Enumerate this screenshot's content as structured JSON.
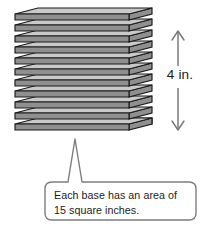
{
  "figure": {
    "name": "stack-of-congruent-bases-with-height",
    "background_color": "#ffffff"
  },
  "stack": {
    "label": "stack of sheets",
    "sheet_count": 11,
    "fill_color": "#c9c9c9",
    "edge_color": "#8f8f8f",
    "outline_color": "#1a1a1a",
    "sheets": [
      {
        "index": 1,
        "top_y": 8
      },
      {
        "index": 2,
        "top_y": 19
      },
      {
        "index": 3,
        "top_y": 30
      },
      {
        "index": 4,
        "top_y": 41
      },
      {
        "index": 5,
        "top_y": 52
      },
      {
        "index": 6,
        "top_y": 63
      },
      {
        "index": 7,
        "top_y": 74
      },
      {
        "index": 8,
        "top_y": 85
      },
      {
        "index": 9,
        "top_y": 96
      },
      {
        "index": 10,
        "top_y": 107
      },
      {
        "index": 11,
        "top_y": 118
      }
    ]
  },
  "dimension": {
    "name": "height-dimension",
    "label": "4 in.",
    "value": 4,
    "unit": "in.",
    "arrow_color": "#7a7a7a",
    "orientation": "vertical",
    "double_headed": true
  },
  "callout": {
    "name": "area-callout",
    "line1": "Each base has an area of",
    "line2": "15 square inches.",
    "full_text": "Each base has an area of 15 square inches.",
    "area_value": 15,
    "area_unit": "square inches",
    "border_color": "#7d7d7d",
    "fill_color": "#ffffff",
    "pointer": "up"
  }
}
